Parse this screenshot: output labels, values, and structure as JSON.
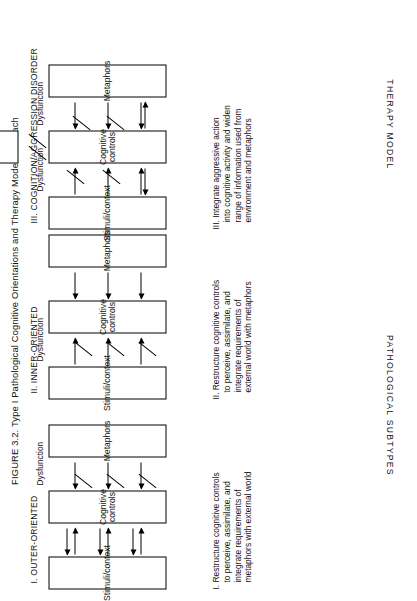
{
  "figure": {
    "title": "FIGURE 3.2. Type I Pathological Cognitive Orientations and Therapy Models for Each",
    "row_labels": {
      "subtypes": "PATHOLOGICAL SUBTYPES",
      "therapy": "THERAPY MODEL"
    },
    "columns": [
      {
        "id": "outer-oriented",
        "header": "I. OUTER-ORIENTED",
        "boxes": {
          "stimuli": "Stimuli/context",
          "controls": "Cognitive controls",
          "metaphors": "Metaphors"
        },
        "dysfunction_label": "Dysfunction",
        "therapy": "I. Restructure cognitive controls to perceive, assimilate, and integrate requirements of metaphors with external world"
      },
      {
        "id": "inner-oriented",
        "header": "II. INNER-ORIENTED",
        "boxes": {
          "stimuli": "Stimuli/context",
          "controls": "Cognitive controls",
          "metaphors": "Metaphors"
        },
        "dysfunction_label": "Dysfunction",
        "therapy": "II. Restructure cognitive controls to perceive, assimilate, and integrate requirements of external world with metaphors"
      },
      {
        "id": "cognition-aggression-disorder",
        "header": "III. COGNITION/AGGRESSION DISORDER",
        "boxes": {
          "stimuli": "Stimuli/context",
          "controls": "Cognitive controls",
          "metaphors": "Metaphors",
          "response": "Response"
        },
        "dysfunction_label_left": "Dysfunction",
        "dysfunction_label_right": "Dysfunction",
        "therapy": "III. Integrate aggressive action into cognitive activity and widen range of information used from environment and metaphors"
      }
    ],
    "colors": {
      "ink": "#111111",
      "paper": "#ffffff"
    }
  }
}
